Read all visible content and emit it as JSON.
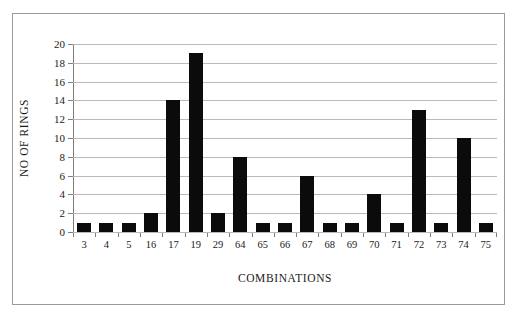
{
  "chart_data": {
    "type": "bar",
    "title": "",
    "xlabel": "COMBINATIONS",
    "ylabel": "NO OF RINGS",
    "categories": [
      "3",
      "4",
      "5",
      "16",
      "17",
      "19",
      "29",
      "64",
      "65",
      "66",
      "67",
      "68",
      "69",
      "70",
      "71",
      "72",
      "73",
      "74",
      "75"
    ],
    "values": [
      1,
      1,
      1,
      2,
      14,
      19,
      2,
      8,
      1,
      1,
      6,
      1,
      1,
      4,
      1,
      13,
      1,
      10,
      1
    ],
    "ylim": [
      0,
      20
    ],
    "ytick_step": 2,
    "yticks": [
      "20",
      "18",
      "16",
      "14",
      "12",
      "10",
      "8",
      "6",
      "4",
      "2",
      "0"
    ],
    "grid": "horizontal",
    "legend": "none",
    "bar_color": "#0b0b0b",
    "grid_color": "#b9b9b9",
    "axis_color": "#7d7d7d",
    "frame_color": "#9a9a9a",
    "background_color": "#ffffff"
  }
}
